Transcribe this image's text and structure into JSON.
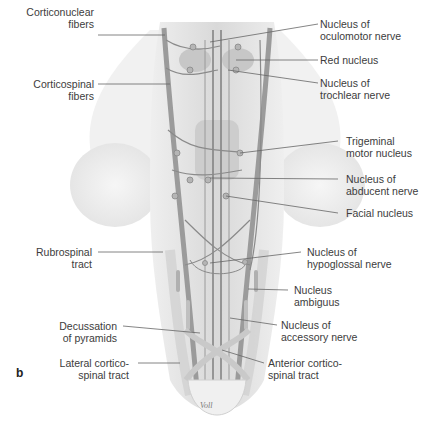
{
  "figure": {
    "panel_letter": "b",
    "signature": "Voll",
    "colors": {
      "background": "#ffffff",
      "tissue_light": "#e6e6e6",
      "tissue_mid": "#cfcfcf",
      "tract_dark": "#8a8a8a",
      "leader_line": "#555555",
      "text": "#3c3c3c"
    },
    "labels_left": [
      {
        "id": "corticonuclear-fibers",
        "line1": "Corticonuclear",
        "line2": "fibers"
      },
      {
        "id": "corticospinal-fibers",
        "line1": "Corticospinal",
        "line2": "fibers"
      },
      {
        "id": "rubrospinal-tract",
        "line1": "Rubrospinal",
        "line2": "tract"
      },
      {
        "id": "decussation-of-pyramids",
        "line1": "Decussation",
        "line2": "of pyramids"
      },
      {
        "id": "lateral-corticospinal-tract",
        "line1": "Lateral cortico-",
        "line2": "spinal tract"
      }
    ],
    "labels_right": [
      {
        "id": "nucleus-of-oculomotor-nerve",
        "line1": "Nucleus of",
        "line2": "oculomotor nerve"
      },
      {
        "id": "red-nucleus",
        "line1": "Red nucleus",
        "line2": ""
      },
      {
        "id": "nucleus-of-trochlear-nerve",
        "line1": "Nucleus of",
        "line2": "trochlear nerve"
      },
      {
        "id": "trigeminal-motor-nucleus",
        "line1": "Trigeminal",
        "line2": "motor nucleus"
      },
      {
        "id": "nucleus-of-abducent-nerve",
        "line1": "Nucleus of",
        "line2": "abducent nerve"
      },
      {
        "id": "facial-nucleus",
        "line1": "Facial nucleus",
        "line2": ""
      },
      {
        "id": "nucleus-of-hypoglossal-nerve",
        "line1": "Nucleus of",
        "line2": "hypoglossal nerve"
      },
      {
        "id": "nucleus-ambiguus",
        "line1": "Nucleus",
        "line2": "ambiguus"
      },
      {
        "id": "nucleus-of-accessory-nerve",
        "line1": "Nucleus of",
        "line2": "accessory nerve"
      },
      {
        "id": "anterior-corticospinal-tract",
        "line1": "Anterior cortico-",
        "line2": "spinal tract"
      }
    ]
  }
}
